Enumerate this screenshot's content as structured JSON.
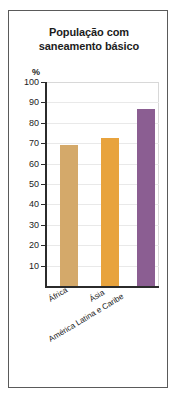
{
  "chart_data": {
    "type": "bar",
    "title": "População com saneamento básico",
    "title_lines": [
      "População com",
      "saneamento básico"
    ],
    "categories": [
      "África",
      "Ásia",
      "América Latina e Caribe"
    ],
    "values": [
      69,
      72.5,
      87
    ],
    "series": [
      {
        "name": "saneamento básico",
        "values": [
          69,
          72.5,
          87
        ],
        "colors": [
          "#d4a96a",
          "#e8a33d",
          "#8b5e92"
        ]
      }
    ],
    "xlabel": "",
    "ylabel": "%",
    "ylim": [
      0,
      100
    ],
    "yticks": [
      100,
      90,
      80,
      70,
      60,
      50,
      40,
      30,
      20,
      10
    ],
    "ytick_labels": [
      "100",
      "90",
      "80",
      "70",
      "60",
      "50",
      "40",
      "30",
      "20",
      "10"
    ],
    "grid": true,
    "legend": false,
    "bar_colors": {
      "africa": "#d4a96a",
      "asia": "#e8a33d",
      "america_latina_caribe": "#8b5e92"
    },
    "axis_color": "#2b2b2b",
    "grid_color": "#e9e9e9",
    "frame_color": "#5a5a5a"
  }
}
